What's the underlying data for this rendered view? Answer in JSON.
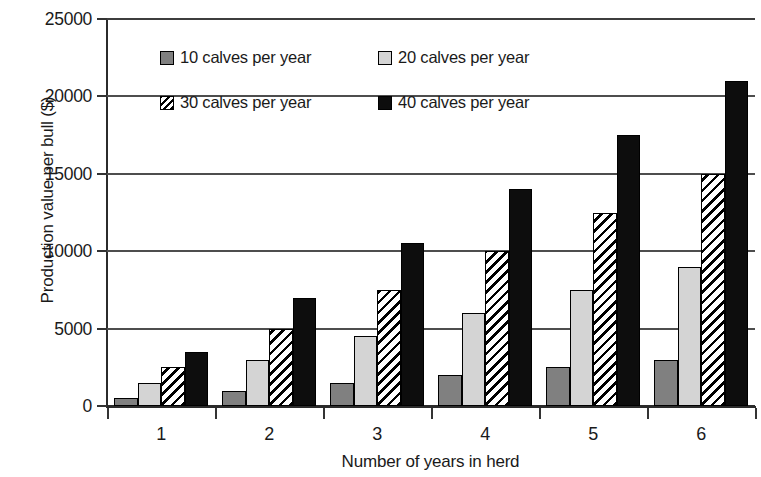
{
  "chart_data": {
    "type": "bar",
    "title": "",
    "subtitle": "",
    "xlabel": "Number of years in herd",
    "ylabel": "Production value per bull ($)",
    "categories": [
      "1",
      "2",
      "3",
      "4",
      "5",
      "6"
    ],
    "series": [
      {
        "name": "10 calves per year",
        "color": "#808080",
        "fill": "solid-gray",
        "values": [
          500,
          1000,
          1500,
          2000,
          2500,
          3000
        ]
      },
      {
        "name": "20 calves per year",
        "color": "#d4d4d4",
        "fill": "solid-light-gray",
        "values": [
          1500,
          3000,
          4500,
          6000,
          7500,
          9000
        ]
      },
      {
        "name": "30 calves per year",
        "color": "#ffffff",
        "fill": "diagonal-hatch",
        "values": [
          2500,
          5000,
          7500,
          10000,
          12500,
          15000
        ]
      },
      {
        "name": "40 calves per year",
        "color": "#0d0d0d",
        "fill": "solid-black",
        "values": [
          3500,
          7000,
          10500,
          14000,
          17500,
          21000
        ]
      }
    ],
    "ylim": [
      0,
      25000
    ],
    "yticks": [
      0,
      5000,
      10000,
      15000,
      20000,
      25000
    ],
    "ytick_labels": [
      "0",
      "5000",
      "10000",
      "15000",
      "20000",
      "25000"
    ],
    "grid": true,
    "grid_axis": "y",
    "legend_position": "upper-left-inside",
    "legend_columns": 2,
    "bar_gap_within_group": 0,
    "background": "#ffffff"
  }
}
